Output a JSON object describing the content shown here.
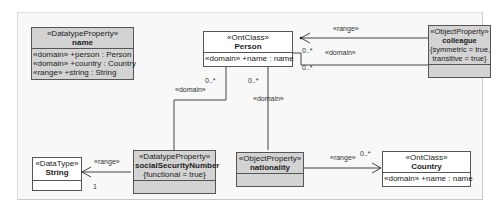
{
  "diagram": {
    "nodes": {
      "name": {
        "stereotype": "«DatatypeProperty»",
        "title": "name",
        "attributes": [
          "«domain» +person : Person",
          "«domain» +country : Country",
          "«range» +string : String"
        ]
      },
      "person": {
        "stereotype": "«OntClass»",
        "title": "Person",
        "attributes": [
          "«domain» +name : name"
        ]
      },
      "colleague": {
        "stereotype": "«ObjectProperty»",
        "title": "colleague",
        "constraint_line1": "{symmetric = true,",
        "constraint_line2": "transitive = true}"
      },
      "string": {
        "stereotype": "«DataType»",
        "title": "String"
      },
      "ssn": {
        "stereotype": "«DatatypeProperty»",
        "title": "socialSecurityNumber",
        "constraint_line1": "{functional = true}"
      },
      "nationality": {
        "stereotype": "«ObjectProperty»",
        "title": "nationality"
      },
      "country": {
        "stereotype": "«OntClass»",
        "title": "Country",
        "attributes": [
          "«domain» +name : name"
        ]
      }
    },
    "edges": {
      "colleague_range": {
        "label": "«range»"
      },
      "colleague_domain": {
        "label": "«domain»",
        "mult_a": "0..*",
        "mult_b": "0..*"
      },
      "ssn_domain": {
        "label": "«domain»",
        "mult": "0..*"
      },
      "nationality_domain": {
        "label": "«domain»",
        "mult": "0..*"
      },
      "ssn_range": {
        "label": "«range»",
        "mult": "1"
      },
      "nationality_range": {
        "label": "«range»",
        "mult": "0..*"
      }
    }
  }
}
